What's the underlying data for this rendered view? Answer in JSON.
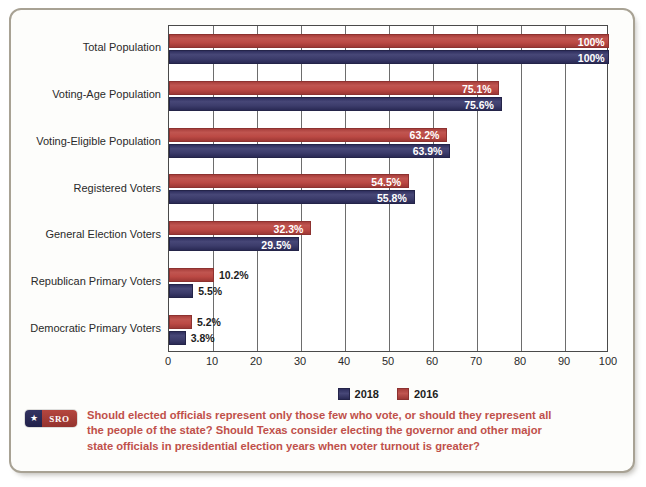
{
  "chart_data": {
    "type": "bar",
    "orientation": "horizontal",
    "title": "",
    "subtitle": "",
    "xlabel": "",
    "ylabel": "",
    "xlim": [
      0,
      100
    ],
    "xticks": [
      "0",
      "10",
      "20",
      "30",
      "40",
      "50",
      "60",
      "70",
      "80",
      "90",
      "100"
    ],
    "grid": true,
    "grid_axis": "x",
    "legend_position": "bottom-center",
    "categories": [
      "Total Population",
      "Voting-Age Population",
      "Voting-Eligible Population",
      "Registered Voters",
      "General Election Voters",
      "Republican Primary Voters",
      "Democratic Primary Voters"
    ],
    "series": [
      {
        "name": "2016",
        "color": "#b8453f",
        "values": [
          100,
          75.1,
          63.2,
          54.5,
          32.3,
          10.2,
          5.2
        ],
        "labels": [
          "100%",
          "75.1%",
          "63.2%",
          "54.5%",
          "32.3%",
          "10.2%",
          "5.2%"
        ]
      },
      {
        "name": "2018",
        "color": "#3a3a6e",
        "values": [
          100,
          75.6,
          63.9,
          55.8,
          29.5,
          5.5,
          3.8
        ],
        "labels": [
          "100%",
          "75.6%",
          "63.9%",
          "55.8%",
          "29.5%",
          "5.5%",
          "3.8%"
        ]
      }
    ]
  },
  "legend": {
    "items": [
      {
        "label": "2018",
        "color": "#3a3a6e"
      },
      {
        "label": "2016",
        "color": "#b8453f"
      }
    ]
  },
  "caption": {
    "badge_star": "★",
    "badge_text": "SRO",
    "text": "Should elected officials represent only those few who vote, or should they represent all the people of the state? Should Texas consider electing the governor and other major state officials in presidential election years when voter turnout is greater?"
  },
  "colors": {
    "red_2016": "#b8453f",
    "blue_2018": "#3a3a6e",
    "frame": "#a8a294",
    "caption_text": "#c0504a",
    "axis": "#4a4a4a"
  }
}
